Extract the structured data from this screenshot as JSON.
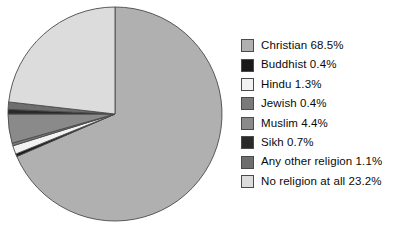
{
  "chart_data": {
    "type": "pie",
    "title": "",
    "subtitle": "",
    "xlabel": "",
    "ylabel": "",
    "units": "percent",
    "legend_position": "right",
    "grid": false,
    "start_angle_deg": 0,
    "direction": "clockwise",
    "categories": [
      "Christian",
      "Buddhist",
      "Hindu",
      "Jewish",
      "Muslim",
      "Sikh",
      "Any other religion",
      "No religion at all"
    ],
    "values": [
      68.5,
      0.4,
      1.3,
      0.4,
      4.4,
      0.7,
      1.1,
      23.2
    ],
    "colors": [
      "#b0b0b0",
      "#1a1a1a",
      "#f2f2f2",
      "#7a7a7a",
      "#8a8a8a",
      "#2a2a2a",
      "#6e6e6e",
      "#dcdcdc"
    ],
    "slice_border_color": "#4a4a4a",
    "labels": [
      "Christian 68.5%",
      "Buddhist 0.4%",
      "Hindu 1.3%",
      "Jewish 0.4%",
      "Muslim 4.4%",
      "Sikh 0.7%",
      "Any other religion 1.1%",
      "No religion at all 23.2%"
    ]
  },
  "legend": {
    "items": [
      {
        "label": "Christian 68.5%",
        "swatch_color": "#b0b0b0",
        "swatch_name": "legend-swatch-christian"
      },
      {
        "label": "Buddhist 0.4%",
        "swatch_color": "#1a1a1a",
        "swatch_name": "legend-swatch-buddhist"
      },
      {
        "label": "Hindu 1.3%",
        "swatch_color": "#f2f2f2",
        "swatch_name": "legend-swatch-hindu"
      },
      {
        "label": "Jewish 0.4%",
        "swatch_color": "#7a7a7a",
        "swatch_name": "legend-swatch-jewish"
      },
      {
        "label": "Muslim 4.4%",
        "swatch_color": "#8a8a8a",
        "swatch_name": "legend-swatch-muslim"
      },
      {
        "label": "Sikh 0.7%",
        "swatch_color": "#2a2a2a",
        "swatch_name": "legend-swatch-sikh"
      },
      {
        "label": "Any other religion 1.1%",
        "swatch_color": "#6e6e6e",
        "swatch_name": "legend-swatch-any-other-religion"
      },
      {
        "label": "No religion at all 23.2%",
        "swatch_color": "#dcdcdc",
        "swatch_name": "legend-swatch-no-religion-at-all"
      }
    ]
  },
  "geometry": {
    "center_x": 115,
    "center_y": 114,
    "radius": 107
  }
}
